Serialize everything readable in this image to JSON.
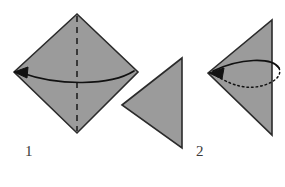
{
  "figure": {
    "type": "origami-fold-diagram",
    "background_color": "#ffffff",
    "paper_fill_color": "#9b9b9b",
    "paper_edge_color": "#2b2b2b",
    "fold_line_color": "#1a1a1a",
    "arrow_color": "#111111",
    "label_color": "#3a3a3a",
    "steps": [
      {
        "number": "1",
        "shape_name": "square-diamond",
        "shape_points": "14,72 77,14 138,72 77,133",
        "crease_name": "vertical-valley-fold-dashed",
        "crease_points": "77,16 77,131",
        "arrow_name": "fold-right-to-left-arrow",
        "arrow_path": "M 134,71 C 110,86 58,86 22,73",
        "arrow_head_points": "14,72 28,67 27,78"
      },
      {
        "number": "2",
        "shape_name": "folded-triangle-left-point",
        "shape_points": "208,73 272,20 272,135",
        "arrow_name": "unfold-loop-arrow",
        "arrow_solid_path": "M 213,71 C 240,58 272,57 279,68",
        "arrow_dotted_path": "M 279,68 C 284,79 264,89 245,87 C 231,85 219,78 214,74",
        "arrow_head_points": "209,73 224,68 222,79"
      }
    ],
    "intermediate_shape": {
      "name": "intermediate-triangle",
      "points": "122,105 182,58 182,148"
    }
  }
}
